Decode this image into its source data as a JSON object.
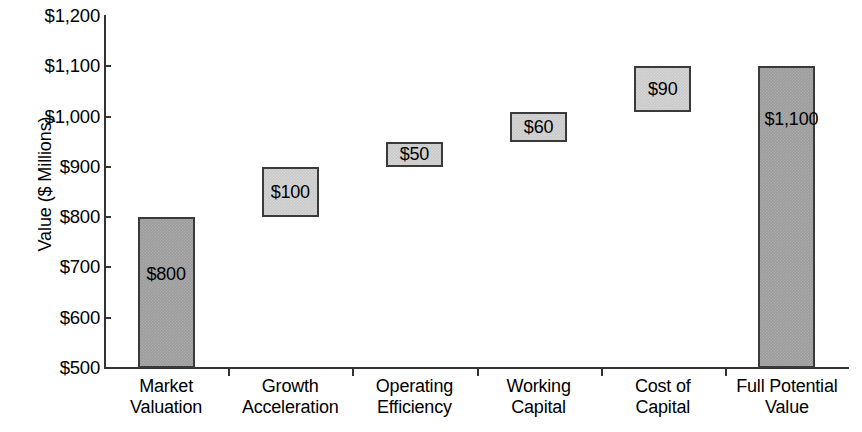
{
  "chart_data": {
    "type": "bar",
    "subtype": "waterfall",
    "title": "",
    "xlabel": "",
    "ylabel": "Value ($ Millions)",
    "ylim": [
      500,
      1200
    ],
    "ytick_step": 100,
    "grid": false,
    "legend": null,
    "categories": [
      "Market Valuation",
      "Growth Acceleration",
      "Operating Efficiency",
      "Working Capital",
      "Cost of Capital",
      "Full Potential Value"
    ],
    "category_lines": [
      [
        "Market",
        "Valuation"
      ],
      [
        "Growth",
        "Acceleration"
      ],
      [
        "Operating",
        "Efficiency"
      ],
      [
        "Working",
        "Capital"
      ],
      [
        "Cost of",
        "Capital"
      ],
      [
        "Full Potential",
        "Value"
      ]
    ],
    "y_tick_labels": [
      "$1,200",
      "$1,100",
      "$1,000",
      "$900",
      "$800",
      "$700",
      "$600",
      "$500"
    ],
    "y_tick_values": [
      1200,
      1100,
      1000,
      900,
      800,
      700,
      600,
      500
    ],
    "values": [
      800,
      100,
      50,
      60,
      90,
      1100
    ],
    "data_labels": [
      "$800",
      "$100",
      "$50",
      "$60",
      "$90",
      "$1,100"
    ],
    "bars": [
      {
        "name": "Market Valuation",
        "label": "$800",
        "value": 800,
        "base": 500,
        "top": 800,
        "kind": "total"
      },
      {
        "name": "Growth Acceleration",
        "label": "$100",
        "value": 100,
        "base": 800,
        "top": 900,
        "kind": "increment"
      },
      {
        "name": "Operating Efficiency",
        "label": "$50",
        "value": 50,
        "base": 900,
        "top": 950,
        "kind": "increment"
      },
      {
        "name": "Working Capital",
        "label": "$60",
        "value": 60,
        "base": 950,
        "top": 1010,
        "kind": "increment"
      },
      {
        "name": "Cost of Capital",
        "label": "$90",
        "value": 90,
        "base": 1010,
        "top": 1100,
        "kind": "increment"
      },
      {
        "name": "Full Potential Value",
        "label": "$1,100",
        "value": 1100,
        "base": 500,
        "top": 1100,
        "kind": "total"
      }
    ],
    "colors": {
      "total_bar_fill": "#9b9b9b",
      "increment_bar_fill": "#c9c9c9",
      "bar_border": "#3a3a3a",
      "axis": "#333333",
      "text": "#000000",
      "background": "#ffffff"
    }
  }
}
